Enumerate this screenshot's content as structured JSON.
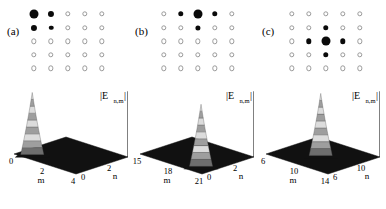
{
  "figure": {
    "kind": "three-panel-scientific-figure",
    "panel_count": 3
  },
  "panels": [
    {
      "tag": "(a)",
      "lattice": {
        "rows": 5,
        "cols": 5,
        "description": "5x5 lattice of site markers; filled disks encode occupied mode amplitude, open circles encode empty sites",
        "amplitudes": [
          [
            1.0,
            0.55,
            0.0,
            0.0,
            0.0
          ],
          [
            0.55,
            0.3,
            0.0,
            0.0,
            0.0
          ],
          [
            0.0,
            0.0,
            0.0,
            0.0,
            0.0
          ],
          [
            0.0,
            0.0,
            0.0,
            0.0,
            0.0
          ],
          [
            0.0,
            0.0,
            0.0,
            0.0,
            0.0
          ]
        ]
      },
      "chart_data": {
        "type": "surface",
        "title": "",
        "zlabel": "|E",
        "zlabel_sub": "n,m",
        "zlabel_tail": "|",
        "xlabel": "m",
        "ylabel": "n",
        "xticks": [
          "0",
          "2",
          "4"
        ],
        "yticks": [
          "0",
          "2",
          "4"
        ],
        "zticks": [
          "0",
          "1",
          "2",
          "3"
        ],
        "zlim": [
          0,
          3
        ],
        "xlim": [
          0,
          4
        ],
        "ylim": [
          0,
          4
        ],
        "peak": {
          "m": 0.6,
          "n": 0.6,
          "height": 3.0
        },
        "surface_color": "#111111",
        "peak_banding": "alternating light and mid gray contour bands",
        "grid": false,
        "legend": "none"
      }
    },
    {
      "tag": "(b)",
      "lattice": {
        "rows": 5,
        "cols": 5,
        "description": "5x5 lattice of site markers; filled disks encode occupied mode amplitude, open circles encode empty sites",
        "amplitudes": [
          [
            0.0,
            0.45,
            1.0,
            0.45,
            0.0
          ],
          [
            0.0,
            0.0,
            0.4,
            0.0,
            0.0
          ],
          [
            0.0,
            0.0,
            0.0,
            0.0,
            0.0
          ],
          [
            0.0,
            0.0,
            0.0,
            0.0,
            0.0
          ],
          [
            0.0,
            0.0,
            0.0,
            0.0,
            0.0
          ]
        ]
      },
      "chart_data": {
        "type": "surface",
        "title": "",
        "zlabel": "|E",
        "zlabel_sub": "n,m",
        "zlabel_tail": "|",
        "xlabel": "m",
        "ylabel": "n",
        "xticks": [
          "15",
          "18",
          "21"
        ],
        "yticks": [
          "0",
          "2",
          "4"
        ],
        "zticks": [
          "0",
          "1",
          "2",
          "3"
        ],
        "zlim": [
          0,
          3
        ],
        "xlim": [
          15,
          21
        ],
        "ylim": [
          0,
          4
        ],
        "peak": {
          "m": 20.2,
          "n": 0.7,
          "height": 3.0
        },
        "surface_color": "#111111",
        "peak_banding": "alternating light and mid gray contour bands",
        "grid": false,
        "legend": "none"
      }
    },
    {
      "tag": "(c)",
      "lattice": {
        "rows": 5,
        "cols": 5,
        "description": "5x5 lattice of site markers; filled disks encode occupied mode amplitude, open circles encode empty sites",
        "amplitudes": [
          [
            0.0,
            0.0,
            0.0,
            0.0,
            0.0
          ],
          [
            0.0,
            0.0,
            0.45,
            0.0,
            0.0
          ],
          [
            0.0,
            0.45,
            1.0,
            0.45,
            0.0
          ],
          [
            0.0,
            0.0,
            0.45,
            0.0,
            0.0
          ],
          [
            0.0,
            0.0,
            0.0,
            0.0,
            0.0
          ]
        ]
      },
      "chart_data": {
        "type": "surface",
        "title": "",
        "zlabel": "|E",
        "zlabel_sub": "n,m",
        "zlabel_tail": "|",
        "xlabel": "m",
        "ylabel": "n",
        "xticks": [
          "6",
          "10",
          "14"
        ],
        "yticks": [
          "6",
          "10",
          "14"
        ],
        "zticks": [
          "0",
          "1",
          "2",
          "3"
        ],
        "zlim": [
          0,
          3
        ],
        "xlim": [
          6,
          14
        ],
        "ylim": [
          6,
          14
        ],
        "peak": {
          "m": 10.0,
          "n": 10.0,
          "height": 3.0
        },
        "surface_color": "#111111",
        "peak_banding": "alternating light and mid gray contour bands",
        "grid": false,
        "legend": "none"
      }
    }
  ],
  "style": {
    "dot_filled_color": "#0a0a0a",
    "dot_open_color": "#9a9a9a",
    "surface_dark": "#111111",
    "band_light": "#dcdcdc",
    "band_mid": "#9e9e9e",
    "band_dark": "#6e6e6e"
  }
}
